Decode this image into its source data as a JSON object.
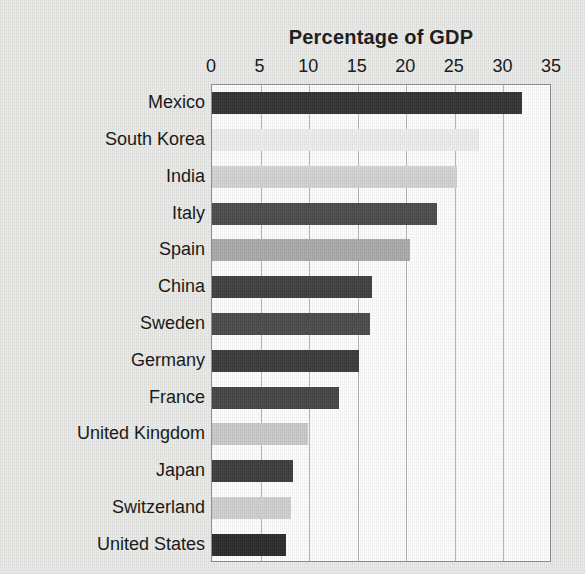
{
  "chart_data": {
    "type": "bar",
    "orientation": "horizontal",
    "title": "Percentage of GDP",
    "xlabel": "",
    "ylabel": "",
    "xlim": [
      0,
      35
    ],
    "ylim": null,
    "grid": true,
    "legend": false,
    "legend_position": "none",
    "xticks": [
      0,
      5,
      10,
      15,
      20,
      25,
      30,
      35
    ],
    "xtick_labels": [
      "0",
      "5",
      "10",
      "15",
      "20",
      "25",
      "30",
      "35"
    ],
    "categories": [
      "Mexico",
      "South Korea",
      "India",
      "Italy",
      "Spain",
      "China",
      "Sweden",
      "Germany",
      "France",
      "United Kingdom",
      "Japan",
      "Switzerland",
      "United States"
    ],
    "values": [
      31.9,
      27.5,
      25.2,
      23.2,
      20.4,
      16.5,
      16.3,
      15.1,
      13.1,
      9.9,
      8.3,
      8.1,
      7.6
    ],
    "bar_colors": [
      "#333333",
      "#ededed",
      "#d2d2d2",
      "#4b4b4b",
      "#a9a9a9",
      "#3f3f3f",
      "#4a4a4a",
      "#3a3a3a",
      "#454545",
      "#c9c9c9",
      "#3c3c3c",
      "#cfcfcf",
      "#2b2b2b"
    ]
  },
  "figure": {
    "background_color": "#e9e9e7",
    "plot_background_color": "#fdfdfd",
    "axis_border_color": "#8e8e8e",
    "gridline_color": "#b4b4b4",
    "text_color": "#141414"
  }
}
